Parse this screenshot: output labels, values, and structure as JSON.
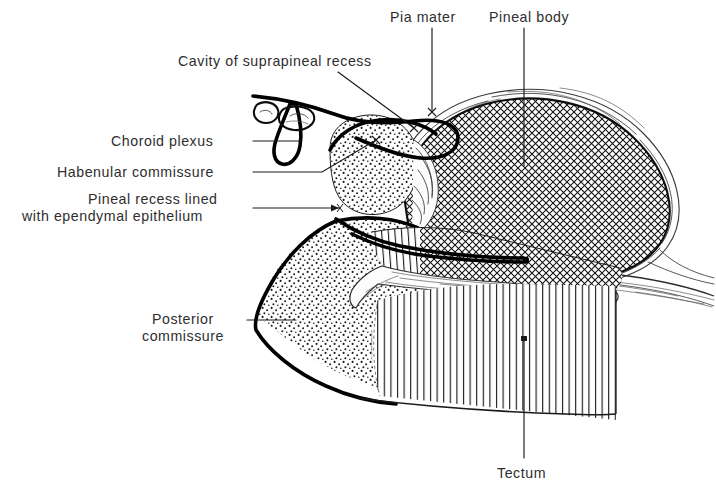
{
  "figure": {
    "background_color": "#ffffff",
    "ink_color": "#000000",
    "text_color": "#2e2e2e",
    "width": 716,
    "height": 501
  },
  "labels": {
    "pia_mater": "Pia mater",
    "pineal_body": "Pineal body",
    "cavity_of_suprapineal_recess": "Cavity of suprapineal recess",
    "choroid_plexus": "Choroid plexus",
    "habenular_commissure": "Habenular commissure",
    "pineal_recess_line1": "Pineal recess lined",
    "pineal_recess_line2": "with ependymal epithelium",
    "posterior_commissure_line1": "Posterior",
    "posterior_commissure_line2": "commissure",
    "tectum": "Tectum"
  },
  "structures": [
    {
      "name": "pineal-body",
      "label": "Pineal body",
      "texture": "cross-hatch",
      "description": "Large ovoid gland filled with dense diagonal cross-hatching, enclosed by a wavy pia mater capsule"
    },
    {
      "name": "habenular-commissure",
      "label": "Habenular commissure",
      "texture": "stipple",
      "description": "Rounded stippled mass at the anterior superior aspect of the pineal stalk"
    },
    {
      "name": "posterior-commissure",
      "label": "Posterior commissure",
      "texture": "stipple",
      "description": "Wedge shaped stippled mass forming the anterior inferior boundary"
    },
    {
      "name": "tectum",
      "label": "Tectum",
      "texture": "vertical-stripe",
      "description": "Large region of fine vertical striations below and behind the pineal body"
    },
    {
      "name": "choroid-plexus",
      "label": "Choroid plexus",
      "texture": "outline-villi",
      "description": "Tongue shaped fold with two detached oval villi above and left of the suprapineal recess"
    },
    {
      "name": "cavity-of-suprapineal-recess",
      "label": "Cavity of suprapineal recess",
      "texture": "blank",
      "description": "Clear crescentic cavity bounded by heavy ependymal lines above the habenular commissure"
    },
    {
      "name": "pineal-recess",
      "label": "Pineal recess lined with ependymal epithelium",
      "texture": "blank",
      "description": "Narrow cleft extending posteriorly into the pineal body between two heavy ependymal lines"
    },
    {
      "name": "pia-mater",
      "label": "Pia mater",
      "texture": "wispy-fibrous",
      "description": "Thin fibrous membrane covering the pineal body and sweeping away to the right"
    }
  ],
  "leader_lines": [
    {
      "name": "pia-mater-leader",
      "style": "vertical",
      "from": "label",
      "to": "pia mater capsule"
    },
    {
      "name": "pineal-body-leader",
      "style": "vertical",
      "from": "label",
      "to": "centre of gland"
    },
    {
      "name": "cavity-of-suprapineal-recess-leader",
      "style": "diagonal",
      "from": "label",
      "to": "recess cavity"
    },
    {
      "name": "choroid-plexus-leader",
      "style": "horizontal",
      "from": "label",
      "to": "plexus fold"
    },
    {
      "name": "habenular-commissure-leader",
      "style": "elbow",
      "from": "label",
      "to": "stippled mass"
    },
    {
      "name": "pineal-recess-leader",
      "style": "horizontal-arrow",
      "from": "label",
      "to": "recess cleft"
    },
    {
      "name": "posterior-commissure-leader",
      "style": "horizontal",
      "from": "label",
      "to": "stippled wedge"
    },
    {
      "name": "tectum-leader",
      "style": "vertical",
      "from": "label",
      "to": "striated tectum"
    }
  ]
}
